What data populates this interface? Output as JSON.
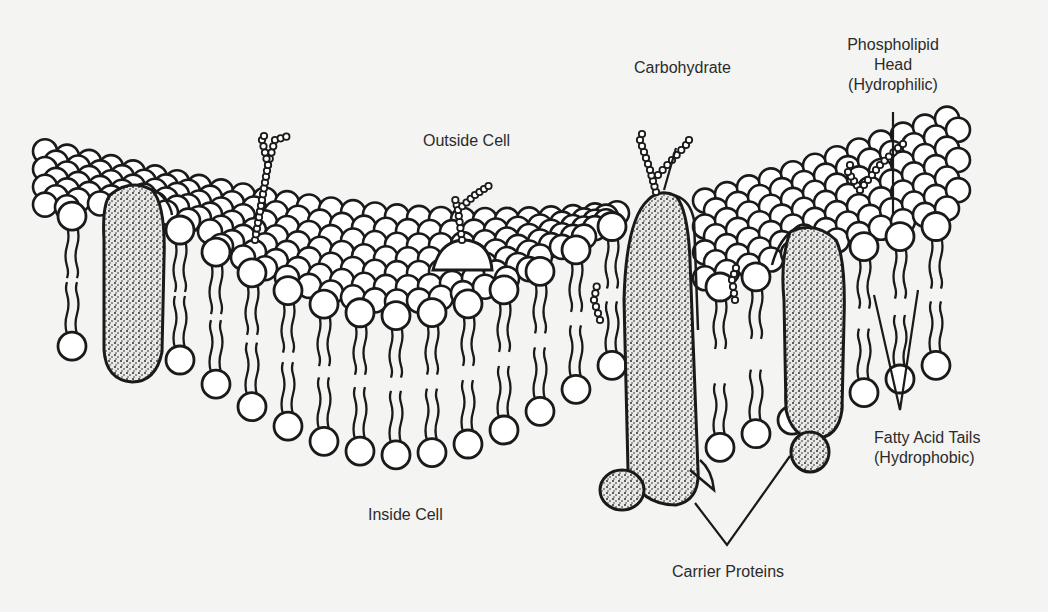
{
  "diagram": {
    "colors": {
      "background": "#f4f4f2",
      "ink": "#1a1a1a",
      "head_fill": "#ffffff",
      "protein_fill": "#d8d8d8",
      "text": "#2b2b2b"
    },
    "regions": {
      "outside": "Outside Cell",
      "inside": "Inside Cell"
    },
    "labels": {
      "carbohydrate": "Carbohydrate",
      "phospholipid_head": {
        "line1": "Phospholipid",
        "line2": "Head",
        "line3": "(Hydrophilic)"
      },
      "fatty_acid_tails": {
        "line1": "Fatty Acid Tails",
        "line2": "(Hydrophobic)"
      },
      "carrier_proteins": "Carrier Proteins"
    },
    "components": [
      {
        "name": "phospholipid-bilayer",
        "description": "Double layer of circular heads with wavy tails"
      },
      {
        "name": "integral-protein-left",
        "description": "Stippled protein spanning bilayer at left"
      },
      {
        "name": "glycoprotein-center",
        "description": "Peripheral protein with carbohydrate chain"
      },
      {
        "name": "carrier-protein-1",
        "description": "Tall stippled carrier protein with carbohydrate"
      },
      {
        "name": "carrier-protein-2",
        "description": "Stippled carrier protein at right"
      },
      {
        "name": "carbohydrate-chains",
        "description": "Beaded chains on outer surface"
      }
    ]
  }
}
